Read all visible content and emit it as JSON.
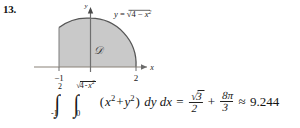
{
  "problem": {
    "number": "13."
  },
  "figure": {
    "name": "region-d-quarter-disk-plot",
    "axes": {
      "x_axis_label": "x",
      "y_axis_label": "y",
      "x_ticks": [
        {
          "label": "-1",
          "value": -1
        },
        {
          "label": "2",
          "value": 2
        }
      ],
      "y_ticks": []
    },
    "curve_label": {
      "lhs": "y",
      "equals": "=",
      "radicand_a": "4",
      "minus": "-",
      "radicand_b": "x",
      "radicand_b_exp": "2"
    },
    "region_label": "D",
    "region_fill_color": "#c8c8c8",
    "curve_color": "#555555",
    "axis_color": "#8a8279"
  },
  "equation": {
    "outer_integral": {
      "lower": "-1",
      "upper": "2"
    },
    "inner_integral": {
      "lower": "0",
      "upper_radicand_a": "4",
      "upper_minus": "-",
      "upper_radicand_b": "x",
      "upper_radicand_b_exp": "2"
    },
    "integrand": {
      "open": "(",
      "term1_base": "x",
      "term1_exp": "2",
      "plus": "+",
      "term2_base": "y",
      "term2_exp": "2",
      "close": ")"
    },
    "differentials": "dy dx",
    "equals": "=",
    "result_term1": {
      "numerator_radicand": "3",
      "denominator": "2"
    },
    "result_plus": "+",
    "result_term2": {
      "numerator": "8π",
      "denominator": "3"
    },
    "approx_sign": "≈",
    "approx_value": "9.244"
  }
}
